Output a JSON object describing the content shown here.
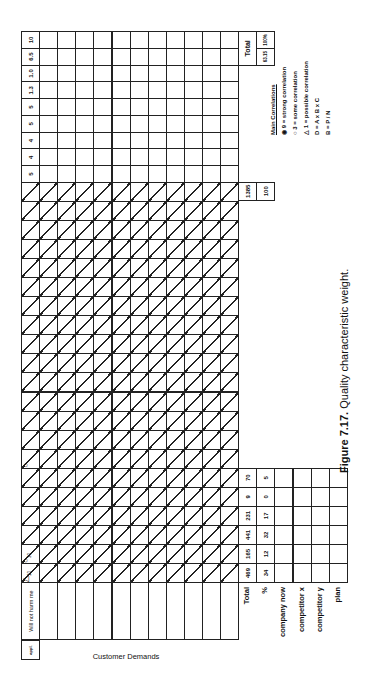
{
  "caption": "Figure 7.17. Quality characteristic weight.",
  "header": {
    "corner_label": "appl.",
    "demands_title": "Customer Demands"
  },
  "demands": [
    "Will not harm me",
    "",
    "",
    "",
    "",
    "",
    "",
    "",
    "",
    "",
    "",
    ""
  ],
  "matrix": {
    "columns": 21,
    "marks": [
      {
        "row": 0,
        "col": 0,
        "symbol": "△",
        "value": "10"
      },
      {
        "row": 0,
        "col": 1,
        "symbol": "○",
        "value": "30"
      },
      {
        "row": 0,
        "col": 6,
        "symbol": "○",
        "value": ""
      }
    ]
  },
  "summary_rows": {
    "total_label": "Total",
    "percent_label": "%",
    "company_now_label": "company now",
    "competitor_x_label": "competitor x",
    "competitor_y_label": "competitor y",
    "plan_label": "plan",
    "totals": [
      "469",
      "165",
      "441",
      "231",
      "9",
      "70"
    ],
    "percents": [
      "34",
      "12",
      "32",
      "17",
      "0",
      "5"
    ],
    "grand_total": "1385",
    "grand_percent": "100"
  },
  "weights": {
    "values": [
      "5",
      "4",
      "4",
      "5",
      "5",
      "1.3",
      "1.0",
      "6.5",
      "10"
    ],
    "total_label": "Total",
    "total_value": "63.15",
    "total_percent": "100%"
  },
  "legend": {
    "title": "Main Correlations",
    "strong": "9 = strong correlation",
    "some": "3 = some correlation",
    "possible": "1 = possible correlation",
    "formula1": "D = A x B x C",
    "formula2": "B = P / N"
  }
}
